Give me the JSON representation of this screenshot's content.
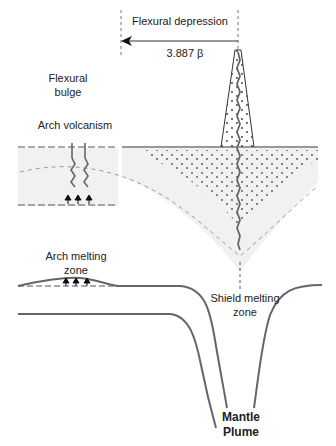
{
  "labels": {
    "flexural_depression": "Flexural depression",
    "distance": "3.887 β",
    "flexural_bulge_1": "Flexural",
    "flexural_bulge_2": "bulge",
    "arch_volcanism": "Arch volcanism",
    "arch_melting_1": "Arch melting",
    "arch_melting_2": "zone",
    "shield_melting_1": "Shield melting",
    "shield_melting_2": "zone",
    "mantle_plume_1": "Mantle",
    "mantle_plume_2": "Plume"
  },
  "colors": {
    "line": "#555555",
    "dashed": "#888888",
    "shade": "#efefef",
    "text": "#222222"
  }
}
